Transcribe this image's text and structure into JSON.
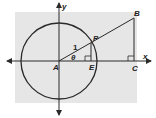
{
  "diagram": {
    "colors": {
      "background": "#ffffff",
      "panel": "#e6e6e6",
      "stroke": "#2a2a2a"
    },
    "labels": {
      "y_axis": "y",
      "x_axis": "x",
      "origin": "A",
      "point_p": "P",
      "point_e": "E",
      "point_b": "B",
      "point_c": "C",
      "radius": "1",
      "angle": "θ"
    },
    "elements": [
      "x-axis (double arrow)",
      "y-axis (double arrow)",
      "unit circle centered at A",
      "segment A-B through P",
      "segment P-E perpendicular to x-axis",
      "segment B-C perpendicular to x-axis",
      "right-angle marks at E and C"
    ]
  }
}
